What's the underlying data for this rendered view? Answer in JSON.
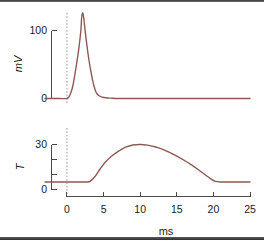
{
  "figure": {
    "background": "#ffffff",
    "trace_color": "#8c5a52",
    "axis_color": "#4a4a4a",
    "marker_color": "#9a9a9a"
  },
  "chart_data": [
    {
      "type": "line",
      "panel": "top",
      "title": "",
      "xlabel": "",
      "ylabel": "mV",
      "xlim": [
        -3,
        25
      ],
      "ylim": [
        0,
        130
      ],
      "yticks": [
        0,
        100
      ],
      "ytick_labels": [
        "0",
        "100"
      ],
      "grid": false,
      "legend": null,
      "annotations": [
        {
          "type": "vline",
          "x": 0,
          "style": "dashed",
          "label": ""
        }
      ],
      "series": [
        {
          "name": "membrane potential",
          "color": "#8c5a52",
          "x": [
            -3.0,
            -2.0,
            -1.0,
            0.0,
            0.3,
            0.7,
            1.0,
            1.3,
            1.6,
            1.9,
            2.0,
            2.15,
            2.3,
            2.5,
            2.7,
            2.9,
            3.1,
            3.3,
            3.5,
            3.7,
            3.9,
            4.1,
            4.4,
            4.8,
            5.3,
            6.0,
            7.0,
            9.0,
            12.0,
            16.0,
            20.0,
            25.0
          ],
          "y": [
            0,
            0,
            0,
            0,
            3,
            14,
            30,
            50,
            72,
            100,
            118,
            126,
            118,
            98,
            80,
            64,
            50,
            38,
            27,
            18,
            11,
            7,
            4,
            2,
            1,
            0.5,
            0,
            0,
            0,
            0,
            0,
            0
          ]
        }
      ]
    },
    {
      "type": "line",
      "panel": "bottom",
      "title": "",
      "xlabel": "ms",
      "ylabel": "T",
      "xlim": [
        -3,
        25
      ],
      "ylim": [
        0,
        33
      ],
      "xticks": [
        0,
        5,
        10,
        15,
        20,
        25
      ],
      "xtick_labels": [
        "0",
        "5",
        "10",
        "15",
        "20",
        "25"
      ],
      "yticks": [
        0,
        10,
        20,
        30
      ],
      "ytick_labels": [
        "0",
        "",
        "",
        "30"
      ],
      "grid": false,
      "legend": null,
      "annotations": [
        {
          "type": "vline",
          "x": 0,
          "style": "dashed",
          "label": ""
        }
      ],
      "series": [
        {
          "name": "temperature",
          "color": "#8c5a52",
          "x": [
            -3.0,
            -1.5,
            0.0,
            1.0,
            2.0,
            2.8,
            3.2,
            3.8,
            4.5,
            5.2,
            6.0,
            7.0,
            8.0,
            9.0,
            10.0,
            11.0,
            12.0,
            13.0,
            14.0,
            15.0,
            16.0,
            17.0,
            18.0,
            19.0,
            19.6,
            20.2,
            21.0,
            22.0,
            23.5,
            25.0
          ],
          "y": [
            5.0,
            5.0,
            5.0,
            5.0,
            5.0,
            5.0,
            5.6,
            8.5,
            13.5,
            18.0,
            21.8,
            25.4,
            28.2,
            29.7,
            30.0,
            29.6,
            28.5,
            26.9,
            24.8,
            22.3,
            19.5,
            16.4,
            13.0,
            9.3,
            7.3,
            5.6,
            5.0,
            5.0,
            5.0,
            5.0
          ]
        }
      ]
    }
  ],
  "axis_labels": {
    "top_y": "mV",
    "bottom_y": "T",
    "x": "ms"
  },
  "tick_text": {
    "top_y": [
      "100",
      "0"
    ],
    "bottom_y": [
      "30",
      "0"
    ],
    "x": [
      "0",
      "5",
      "10",
      "15",
      "20",
      "25"
    ]
  }
}
